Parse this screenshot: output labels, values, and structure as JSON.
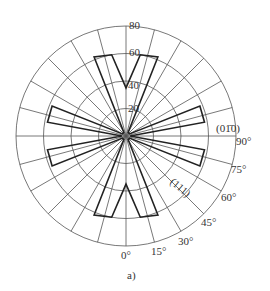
{
  "chart_data": {
    "type": "polar-line",
    "title": "",
    "caption": "a)",
    "radial_ticks": [
      "20",
      "40",
      "60",
      "80"
    ],
    "rlim": [
      0,
      80
    ],
    "angle_ticks": [
      "0°",
      "15°",
      "30°",
      "45°",
      "60°",
      "75°",
      "90°"
    ],
    "angular_grid_step_deg": 15,
    "annotations": [
      "(01̄0)",
      "(111)"
    ],
    "series": [
      {
        "name": "profile",
        "angles_deg": [
          0,
          10,
          22,
          30,
          45,
          60,
          68,
          80,
          90
        ],
        "radii": [
          35,
          60,
          62,
          3,
          3,
          3,
          58,
          58,
          3
        ]
      }
    ]
  },
  "labels": {
    "r20": "20",
    "r40": "40",
    "r60": "60",
    "r80": "80",
    "a0": "0°",
    "a15": "15°",
    "a30": "30°",
    "a45": "45°",
    "a60": "60°",
    "a75": "75°",
    "a90": "90°",
    "plane010": "(01̄0)",
    "plane111": "(111)",
    "caption": "a)"
  }
}
